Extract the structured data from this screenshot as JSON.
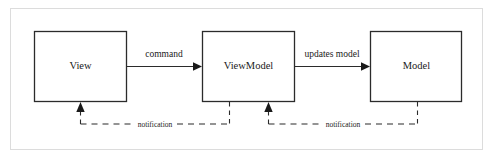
{
  "figure": {
    "type": "mvvm-architecture-diagram",
    "background_color": "#ffffff",
    "frame": {
      "name": "outer-frame",
      "color": "#dcdcdc",
      "x": 10,
      "y": 8,
      "width": 473,
      "height": 142
    },
    "stroke_color": "#2b2b2b",
    "box_fill": "#ffffff",
    "boxes": [
      {
        "id": "view",
        "label": "View",
        "x": 34,
        "y": 31,
        "width": 93,
        "height": 71
      },
      {
        "id": "viewmodel",
        "label": "ViewModel",
        "x": 202,
        "y": 31,
        "width": 93,
        "height": 71
      },
      {
        "id": "model",
        "label": "Model",
        "x": 370,
        "y": 31,
        "width": 92,
        "height": 71
      }
    ],
    "solid_arrows": [
      {
        "id": "command-arrow",
        "label": "command",
        "from": "view",
        "to": "viewmodel",
        "x1": 127,
        "x2": 202,
        "y": 66,
        "label_x": 164,
        "label_y": 57
      },
      {
        "id": "updates-model-arrow",
        "label": "updates model",
        "from": "viewmodel",
        "to": "model",
        "x1": 295,
        "x2": 370,
        "y": 66,
        "label_x": 332,
        "label_y": 57
      }
    ],
    "dashed_arrows": [
      {
        "id": "notification-viewmodel-to-view",
        "label": "notification",
        "from": "viewmodel",
        "to": "view",
        "source_x": 229,
        "target_x": 80,
        "source_top_y": 102,
        "bottom_y": 124,
        "target_top_y": 104,
        "label_x": 155,
        "label_y": 126
      },
      {
        "id": "notification-model-to-viewmodel",
        "label": "notification",
        "from": "model",
        "to": "viewmodel",
        "source_x": 417,
        "target_x": 268,
        "source_top_y": 102,
        "bottom_y": 124,
        "target_top_y": 104,
        "label_x": 343,
        "label_y": 126
      }
    ]
  }
}
